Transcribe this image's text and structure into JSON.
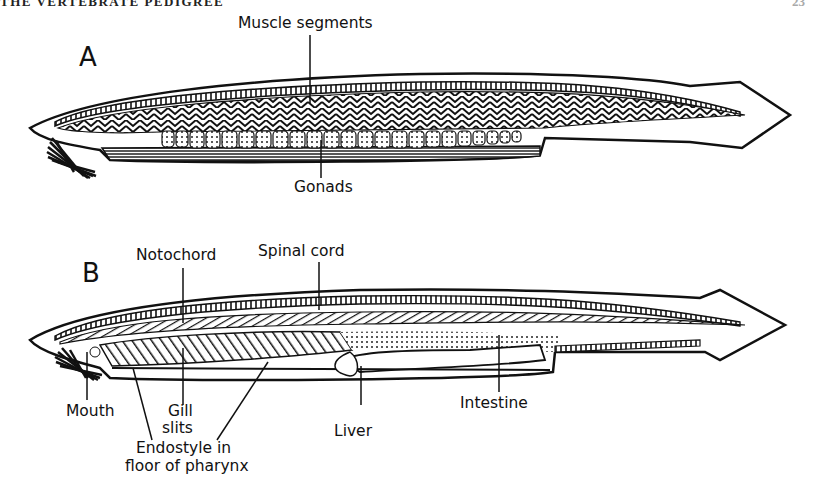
{
  "page": {
    "running_head": "THE VERTEBRATE PEDIGREE",
    "page_number": "23"
  },
  "figure": {
    "panel_a": {
      "letter": "A",
      "labels": {
        "muscle_segments": "Muscle segments",
        "gonads": "Gonads"
      }
    },
    "panel_b": {
      "letter": "B",
      "labels": {
        "notochord": "Notochord",
        "spinal_cord": "Spinal cord",
        "mouth": "Mouth",
        "gill_slits_line1": "Gill",
        "gill_slits_line2": "slits",
        "endostyle_line1": "Endostyle in",
        "endostyle_line2": "floor of pharynx",
        "liver": "Liver",
        "intestine": "Intestine"
      }
    }
  }
}
